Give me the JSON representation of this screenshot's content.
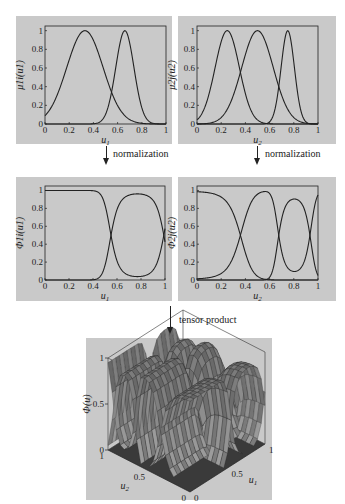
{
  "chart_data": [
    {
      "type": "line",
      "id": "mu1",
      "title": "",
      "xlabel": "u1",
      "ylabel": "μ_1i(u_1)",
      "xlim": [
        0,
        1
      ],
      "ylim": [
        0,
        1.05
      ],
      "xticks": [
        "0",
        "0.2",
        "0.4",
        "0.6",
        "0.8",
        "1"
      ],
      "yticks": [
        "0",
        "0.2",
        "0.4",
        "0.6",
        "0.8",
        "1"
      ],
      "grid": false,
      "series": [
        {
          "name": "mu11",
          "shape": "bell",
          "center": 0.33,
          "width": 0.15,
          "peak": 1.0
        },
        {
          "name": "mu12",
          "shape": "bell",
          "center": 0.66,
          "width": 0.075,
          "peak": 1.0
        }
      ]
    },
    {
      "type": "line",
      "id": "mu2",
      "title": "",
      "xlabel": "u2",
      "ylabel": "μ_2j(u_2)",
      "xlim": [
        0,
        1
      ],
      "ylim": [
        0,
        1.05
      ],
      "xticks": [
        "0",
        "0.2",
        "0.4",
        "0.6",
        "0.8",
        "1"
      ],
      "yticks": [
        "0",
        "0.2",
        "0.4",
        "0.6",
        "0.8",
        "1"
      ],
      "grid": false,
      "series": [
        {
          "name": "mu21",
          "shape": "bell",
          "center": 0.25,
          "width": 0.1,
          "peak": 1.0
        },
        {
          "name": "mu22",
          "shape": "bell",
          "center": 0.5,
          "width": 0.13,
          "peak": 1.0
        },
        {
          "name": "mu23",
          "shape": "bell",
          "center": 0.75,
          "width": 0.055,
          "peak": 1.0
        }
      ]
    },
    {
      "type": "line",
      "id": "phi1",
      "title": "",
      "xlabel": "u1",
      "ylabel": "Φ_1i(u_1)",
      "xlim": [
        0,
        1
      ],
      "ylim": [
        0,
        1.05
      ],
      "xticks": [
        "0",
        "0.2",
        "0.4",
        "0.6",
        "0.8",
        "1"
      ],
      "yticks": [
        "0",
        "0.2",
        "0.4",
        "0.6",
        "0.8",
        "1"
      ],
      "grid": false,
      "series": [
        {
          "name": "phi11",
          "x": [
            0,
            0.1,
            0.2,
            0.3,
            0.4,
            0.45,
            0.5,
            0.55,
            0.6,
            0.65,
            0.7,
            0.8,
            0.9,
            0.95,
            1.0
          ],
          "y": [
            1.0,
            1.0,
            1.0,
            1.0,
            0.99,
            0.96,
            0.8,
            0.5,
            0.15,
            0.05,
            0.02,
            0.01,
            0.02,
            0.1,
            0.5
          ]
        },
        {
          "name": "phi12",
          "x": [
            0,
            0.1,
            0.2,
            0.3,
            0.4,
            0.45,
            0.5,
            0.55,
            0.6,
            0.65,
            0.7,
            0.8,
            0.9,
            0.95,
            1.0
          ],
          "y": [
            0.0,
            0.0,
            0.0,
            0.0,
            0.01,
            0.04,
            0.2,
            0.5,
            0.85,
            0.95,
            0.98,
            0.99,
            0.98,
            0.9,
            0.5
          ]
        }
      ]
    },
    {
      "type": "line",
      "id": "phi2",
      "title": "",
      "xlabel": "u2",
      "ylabel": "Φ_2j(u_2)",
      "xlim": [
        0,
        1
      ],
      "ylim": [
        0,
        1.05
      ],
      "xticks": [
        "0",
        "0.2",
        "0.4",
        "0.6",
        "0.8",
        "1"
      ],
      "yticks": [
        "0",
        "0.2",
        "0.4",
        "0.6",
        "0.8",
        "1"
      ],
      "grid": false,
      "series": [
        {
          "name": "phi21",
          "x": [
            0,
            0.1,
            0.2,
            0.3,
            0.35,
            0.4,
            0.5,
            0.57,
            0.6,
            0.65,
            0.7,
            0.8,
            0.9,
            1.0
          ],
          "y": [
            0.97,
            0.95,
            0.85,
            0.62,
            0.5,
            0.35,
            0.08,
            0.02,
            0.03,
            0.1,
            0.2,
            0.15,
            0.1,
            0.02
          ]
        },
        {
          "name": "phi22",
          "x": [
            0,
            0.1,
            0.2,
            0.3,
            0.35,
            0.4,
            0.5,
            0.57,
            0.6,
            0.65,
            0.68,
            0.75,
            0.8,
            0.85,
            0.9,
            1.0
          ],
          "y": [
            0.03,
            0.05,
            0.15,
            0.38,
            0.5,
            0.65,
            0.92,
            0.98,
            0.95,
            0.7,
            0.5,
            0.2,
            0.15,
            0.2,
            0.5,
            0.98
          ]
        },
        {
          "name": "phi23",
          "x": [
            0.6,
            0.65,
            0.68,
            0.7,
            0.75,
            0.8,
            0.85,
            0.9,
            0.95,
            1.0
          ],
          "y": [
            0.02,
            0.2,
            0.5,
            0.7,
            0.83,
            0.85,
            0.75,
            0.5,
            0.15,
            0.02
          ]
        }
      ]
    },
    {
      "type": "surface",
      "id": "phi3d",
      "title": "",
      "xlabel": "u1",
      "ylabel": "u2",
      "zlabel": "Φ(u)",
      "xticks": [
        "0",
        "0.5",
        "1"
      ],
      "yticks": [
        "0",
        "0.5",
        "1"
      ],
      "zticks": [
        "0",
        "0.5",
        "1"
      ],
      "zlim": [
        0,
        1
      ],
      "note": "tensor product surfaces of Φ_1i(u_1)·Φ_2j(u_2)"
    }
  ],
  "labels": {
    "arrow_left": "normalization",
    "arrow_right": "normalization",
    "arrow_bottom": "tensor product",
    "p1_xlabel": "u",
    "p1_xsub": "1",
    "p2_xlabel": "u",
    "p2_xsub": "2",
    "p3_xlabel": "u",
    "p3_xsub": "1",
    "p4_xlabel": "u",
    "p4_xsub": "2",
    "p1_ylabel": "μ1i(u1)",
    "p2_ylabel": "μ2j(u2)",
    "p3_ylabel": "Φ1i(u1)",
    "p4_ylabel": "Φ2j(u2)",
    "p5_zlabel": "Φ(u)",
    "p5_u1": "u",
    "p5_u1sub": "1",
    "p5_u2": "u",
    "p5_u2sub": "2"
  },
  "ticks": {
    "x": [
      "0",
      "0.2",
      "0.4",
      "0.6",
      "0.8",
      "1"
    ],
    "y": [
      "0",
      "0.2",
      "0.4",
      "0.6",
      "0.8",
      "1"
    ],
    "z3d": [
      "0",
      "0.5",
      "1"
    ],
    "u1_3d": [
      "0",
      "0.5",
      "1"
    ],
    "u2_3d": [
      "0",
      "0.5",
      "1"
    ]
  },
  "colors": {
    "panel_bg": "#c9c9c9",
    "line": "#222222",
    "surface_dark": "#2e2e2e",
    "surface_light": "#9a9a9a"
  }
}
